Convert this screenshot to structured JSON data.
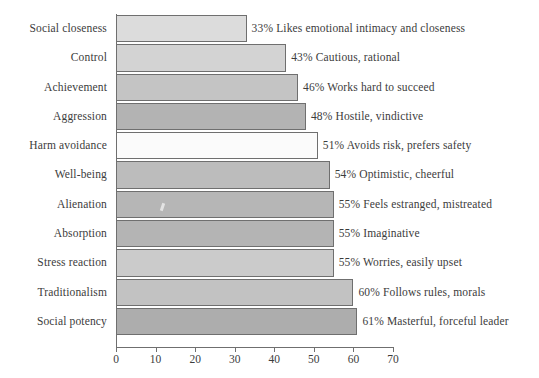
{
  "chart_data": {
    "type": "bar",
    "orientation": "horizontal",
    "title": "",
    "subtitle": "",
    "xlabel": "",
    "ylabel": "",
    "xlim": [
      0,
      70
    ],
    "xticks": [
      0,
      10,
      20,
      30,
      40,
      50,
      60,
      70
    ],
    "xtick_labels": [
      "0",
      "10",
      "20",
      "30",
      "40",
      "50",
      "60",
      "70"
    ],
    "grid": false,
    "legend": "none",
    "categories": [
      "Social closeness",
      "Control",
      "Achievement",
      "Aggression",
      "Harm avoidance",
      "Well-being",
      "Alienation",
      "Absorption",
      "Stress reaction",
      "Traditionalism",
      "Social potency"
    ],
    "values": [
      33,
      43,
      46,
      48,
      51,
      54,
      55,
      55,
      55,
      60,
      61
    ],
    "value_labels": [
      "33% Likes emotional intimacy and closeness",
      "43% Cautious, rational",
      "46% Works hard to succeed",
      "48% Hostile, vindictive",
      "51% Avoids risk, prefers safety",
      "54% Optimistic, cheerful",
      "55% Feels estranged, mistreated",
      "55% Imaginative",
      "55% Worries, easily upset",
      "60% Follows rules, morals",
      "61% Masterful, forceful leader"
    ],
    "descriptions": [
      "Likes emotional intimacy and closeness",
      "Cautious, rational",
      "Works hard to succeed",
      "Hostile, vindictive",
      "Avoids risk, prefers safety",
      "Optimistic, cheerful",
      "Feels estranged, mistreated",
      "Imaginative",
      "Worries, easily upset",
      "Follows rules, morals",
      "Masterful, forceful leader"
    ],
    "bar_colors": [
      "#dcdcdc",
      "#d3d3d3",
      "#c4c4c4",
      "#b3b3b3",
      "#fbfbfb",
      "#bcbcbc",
      "#b6b6b6",
      "#b4b4b4",
      "#cbcbcb",
      "#c2c2c2",
      "#adadad"
    ],
    "bar_edge_color": "#6f6f6f",
    "axis_color": "#6f6f6f",
    "text_color": "#3c3c3c",
    "background_color": "#ffffff"
  }
}
